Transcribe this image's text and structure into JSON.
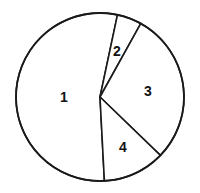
{
  "chart_data": {
    "type": "pie",
    "title": "",
    "categories": [
      "1",
      "2",
      "3",
      "4"
    ],
    "values": [
      54,
      5,
      29,
      12
    ],
    "start_angle_deg": 12,
    "direction": "clockwise",
    "legend": "none",
    "center": [
      100,
      97
    ],
    "radius": 84,
    "slices": [
      {
        "label": "1",
        "value": 54,
        "from_deg": 177,
        "to_deg": 372,
        "label_pos": [
          64,
          97
        ]
      },
      {
        "label": "2",
        "value": 5,
        "from_deg": 12,
        "to_deg": 29,
        "label_pos": [
          117,
          51
        ]
      },
      {
        "label": "3",
        "value": 29,
        "from_deg": 29,
        "to_deg": 134,
        "label_pos": [
          148,
          91
        ]
      },
      {
        "label": "4",
        "value": 12,
        "from_deg": 134,
        "to_deg": 177,
        "label_pos": [
          123,
          147
        ]
      }
    ],
    "colors": {
      "fill": "#ffffff",
      "stroke": "#1a1a1a",
      "label": "#111111"
    }
  }
}
